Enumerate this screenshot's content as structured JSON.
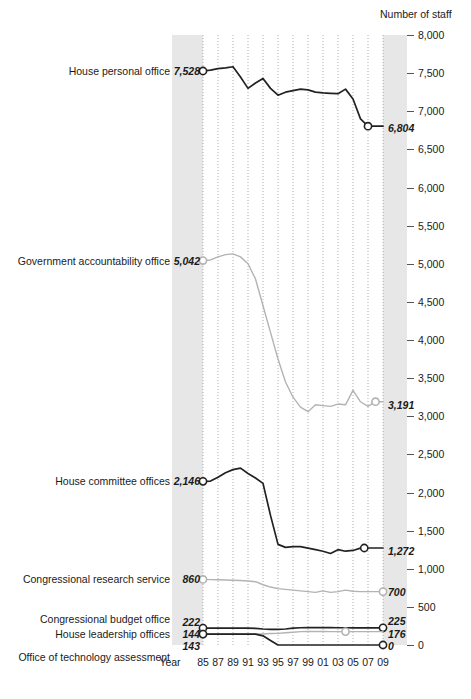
{
  "chart_data": {
    "type": "line",
    "title": "",
    "xlabel": "Year",
    "ylabel": "Number of staff",
    "ylim": [
      0,
      8000
    ],
    "grid": true,
    "legend_position": "inline-left-labels",
    "x": [
      1985,
      1986,
      1987,
      1988,
      1989,
      1990,
      1991,
      1992,
      1993,
      1994,
      1995,
      1996,
      1997,
      1998,
      1999,
      2000,
      2001,
      2002,
      2003,
      2004,
      2005,
      2006,
      2007,
      2008,
      2009
    ],
    "xtick_labels": [
      "85",
      "87",
      "89",
      "91",
      "93",
      "95",
      "97",
      "99",
      "01",
      "03",
      "05",
      "07",
      "09"
    ],
    "xtick_years": [
      1985,
      1987,
      1989,
      1991,
      1993,
      1995,
      1997,
      1999,
      2001,
      2003,
      2005,
      2007,
      2009
    ],
    "ytick_labels": [
      "8,000",
      "7,500",
      "7,000",
      "6,500",
      "6,000",
      "5,500",
      "5,000",
      "4,500",
      "4,000",
      "3,500",
      "3,000",
      "2,500",
      "2,000",
      "1,500",
      "1,000",
      "500",
      "0"
    ],
    "ytick_values": [
      8000,
      7500,
      7000,
      6500,
      6000,
      5500,
      5000,
      4500,
      4000,
      3500,
      3000,
      2500,
      2000,
      1500,
      1000,
      500,
      0
    ],
    "series": [
      {
        "name": "House personal office",
        "label": "House personal office",
        "color": "#222222",
        "start_label": "7,528",
        "end_label": "6,804",
        "start_value": 7528,
        "end_value": 6804,
        "values": [
          7528,
          7540,
          7560,
          7570,
          7584,
          7450,
          7300,
          7370,
          7430,
          7300,
          7210,
          7250,
          7270,
          7290,
          7280,
          7250,
          7240,
          7235,
          7230,
          7290,
          7160,
          6900,
          6804,
          6804,
          6804
        ]
      },
      {
        "name": "Government accountability office",
        "label": "Government accountability office",
        "color": "#b3b3b3",
        "start_label": "5,042",
        "end_label": "3,191",
        "start_value": 5042,
        "end_value": 3191,
        "values": [
          5042,
          5050,
          5090,
          5120,
          5130,
          5090,
          5000,
          4800,
          4450,
          4100,
          3750,
          3450,
          3250,
          3120,
          3060,
          3150,
          3140,
          3130,
          3160,
          3150,
          3340,
          3190,
          3130,
          3191,
          3191
        ]
      },
      {
        "name": "House committee offices",
        "label": "House committee offices",
        "color": "#222222",
        "start_label": "2,146",
        "end_label": "1,272",
        "start_value": 2146,
        "end_value": 1272,
        "values": [
          2146,
          2150,
          2200,
          2260,
          2300,
          2320,
          2250,
          2190,
          2120,
          1700,
          1320,
          1280,
          1290,
          1290,
          1270,
          1250,
          1230,
          1200,
          1250,
          1230,
          1240,
          1270,
          1272,
          1272,
          1272
        ]
      },
      {
        "name": "Congressional research service",
        "label": "Congressional research service",
        "color": "#b3b3b3",
        "start_label": "860",
        "end_label": "700",
        "start_value": 860,
        "end_value": 700,
        "values": [
          860,
          858,
          855,
          852,
          850,
          845,
          840,
          830,
          790,
          760,
          740,
          730,
          720,
          710,
          700,
          690,
          710,
          690,
          700,
          720,
          705,
          700,
          700,
          700,
          700
        ]
      },
      {
        "name": "Congressional budget office",
        "label": "Congressional budget office",
        "color": "#222222",
        "start_label": "222",
        "end_label": "225",
        "start_value": 222,
        "end_value": 225,
        "values": [
          222,
          222,
          222,
          222,
          222,
          222,
          222,
          218,
          210,
          205,
          205,
          210,
          222,
          226,
          228,
          228,
          228,
          228,
          226,
          226,
          225,
          225,
          225,
          225,
          225
        ]
      },
      {
        "name": "House leadership offices",
        "label": "House leadership offices",
        "color": "#b3b3b3",
        "start_label": "144",
        "end_label": "176",
        "start_value": 144,
        "end_value": 176,
        "values": [
          144,
          144,
          144,
          144,
          144,
          144,
          144,
          144,
          145,
          150,
          152,
          160,
          168,
          176,
          178,
          178,
          178,
          176,
          176,
          176,
          176,
          176,
          176,
          176,
          176
        ]
      },
      {
        "name": "Office of technology assessment",
        "label": "Office of technology assessment",
        "color": "#222222",
        "start_label": "143",
        "end_label": "0",
        "start_value": 143,
        "end_value": 0,
        "values": [
          143,
          143,
          143,
          143,
          143,
          143,
          143,
          143,
          120,
          60,
          0,
          0,
          0,
          0,
          0,
          0,
          0,
          0,
          0,
          0,
          0,
          0,
          0,
          0,
          0
        ]
      }
    ]
  },
  "labels": {
    "axis_y_title": "Number of staff",
    "axis_x_title": "Year"
  }
}
